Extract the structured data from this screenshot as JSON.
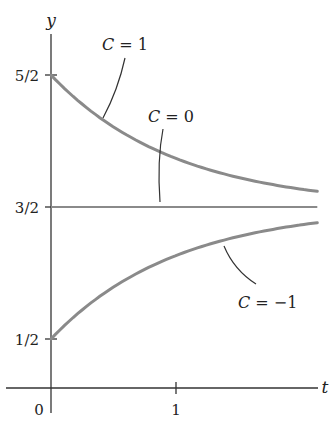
{
  "chart_data": {
    "type": "line",
    "title": "",
    "xlabel": "t",
    "ylabel": "y",
    "equation": "y = 3/2 + C e^(-t)",
    "xlim": [
      0,
      2.1
    ],
    "ylim": [
      0,
      2.75
    ],
    "grid": false,
    "legend": "none (inline annotations)",
    "x_ticks": [
      {
        "value": 0,
        "label": "0"
      },
      {
        "value": 1,
        "label": "1"
      }
    ],
    "y_ticks": [
      {
        "value": 0.5,
        "label": "1/2"
      },
      {
        "value": 1.5,
        "label": "3/2"
      },
      {
        "value": 2.5,
        "label": "5/2"
      }
    ],
    "series": [
      {
        "name": "C = 1",
        "C": 1,
        "y0": 2.5,
        "asymptote": 1.5,
        "x": [
          0,
          0.25,
          0.5,
          0.75,
          1,
          1.25,
          1.5,
          1.75,
          2.1
        ],
        "values": [
          2.5,
          2.28,
          2.11,
          1.97,
          1.87,
          1.79,
          1.72,
          1.67,
          1.62
        ]
      },
      {
        "name": "C = 0",
        "C": 0,
        "y0": 1.5,
        "asymptote": 1.5,
        "x": [
          0,
          2.1
        ],
        "values": [
          1.5,
          1.5
        ]
      },
      {
        "name": "C = -1",
        "C": -1,
        "y0": 0.5,
        "asymptote": 1.5,
        "x": [
          0,
          0.25,
          0.5,
          0.75,
          1,
          1.25,
          1.5,
          1.75,
          2.1
        ],
        "values": [
          0.5,
          0.72,
          0.89,
          1.03,
          1.13,
          1.21,
          1.28,
          1.33,
          1.38
        ]
      }
    ],
    "annotations": [
      {
        "text_var": "C",
        "text_rest": " = 1",
        "target_series": "C = 1"
      },
      {
        "text_var": "C",
        "text_rest": " = 0",
        "target_series": "C = 0"
      },
      {
        "text_var": "C",
        "text_rest": " = −1",
        "target_series": "C = -1"
      }
    ],
    "colors": {
      "curve": "#8a8a8a",
      "axis": "#333333",
      "text": "#222222"
    }
  }
}
